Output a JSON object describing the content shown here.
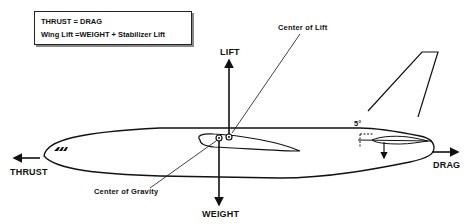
{
  "equations": {
    "line1": "THRUST = DRAG",
    "line2": "Wing Lift =WEIGHT + Stabilizer Lift"
  },
  "labels": {
    "lift": "LIFT",
    "weight": "WEIGHT",
    "thrust": "THRUST",
    "drag": "DRAG",
    "center_of_lift": "Center of Lift",
    "center_of_gravity": "Center of Gravity",
    "stabilizer_angle": "5°"
  },
  "colors": {
    "ink": "#111111",
    "background": "#ffffff"
  }
}
